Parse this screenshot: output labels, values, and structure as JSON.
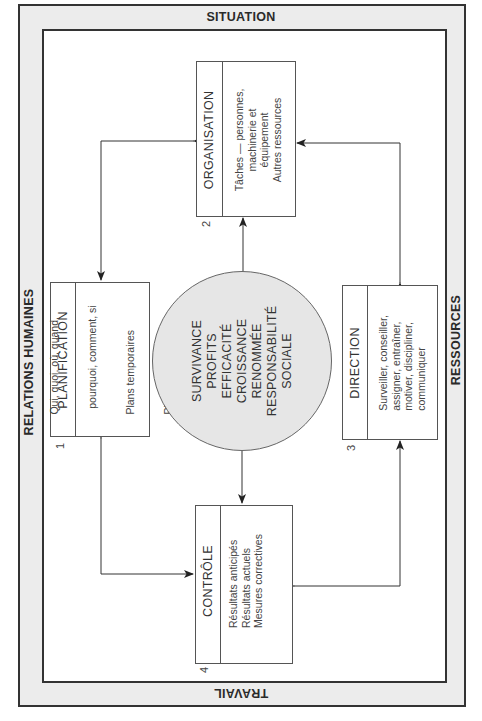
{
  "frame": {
    "top_label": "SITUATION",
    "right_label": "RESSOURCES",
    "bottom_label": "TRAVAIL",
    "left_label": "RELATIONS HUMAINES",
    "band_color": "#ececec",
    "border_color": "#333333"
  },
  "center": {
    "fill_color": "#e6e6e6",
    "goals": [
      "SURVIVANCE",
      "PROFITS",
      "EFFICACITÉ",
      "CROISSANCE",
      "RENOMMÉE",
      "RESPONSABILITÉ",
      "SOCIALE"
    ]
  },
  "boxes": {
    "planification": {
      "number": "1",
      "title": "PLANIFICATION",
      "lines": [
        "Qui, quoi, où, quand,",
        "  pourquoi, comment, si",
        "Plans temporaires",
        "Plans permanents"
      ]
    },
    "organisation": {
      "number": "2",
      "title": "ORGANISATION",
      "lines": [
        "Tâches — personnes,",
        "machinerie et",
        "équipement",
        "Autres ressources"
      ]
    },
    "direction": {
      "number": "3",
      "title": "DIRECTION",
      "lines": [
        "Surveiller, conseiller,",
        "assigner, entraîner,",
        "motiver, discipliner,",
        "communiquer"
      ]
    },
    "controle": {
      "number": "4",
      "title": "CONTRÔLE",
      "lines": [
        "Résultats anticipés",
        "Résultats actuels",
        "Mesures correctives"
      ]
    }
  },
  "connectors": [
    {
      "from": "organisation",
      "to": "planification",
      "bidirectional": true
    },
    {
      "from": "planification",
      "to": "controle",
      "bidirectional": true
    },
    {
      "from": "controle",
      "to": "direction",
      "bidirectional": true
    },
    {
      "from": "direction",
      "to": "organisation",
      "bidirectional": true
    },
    {
      "from": "center",
      "to": "organisation",
      "bidirectional": false
    },
    {
      "from": "center",
      "to": "controle",
      "bidirectional": false
    }
  ]
}
